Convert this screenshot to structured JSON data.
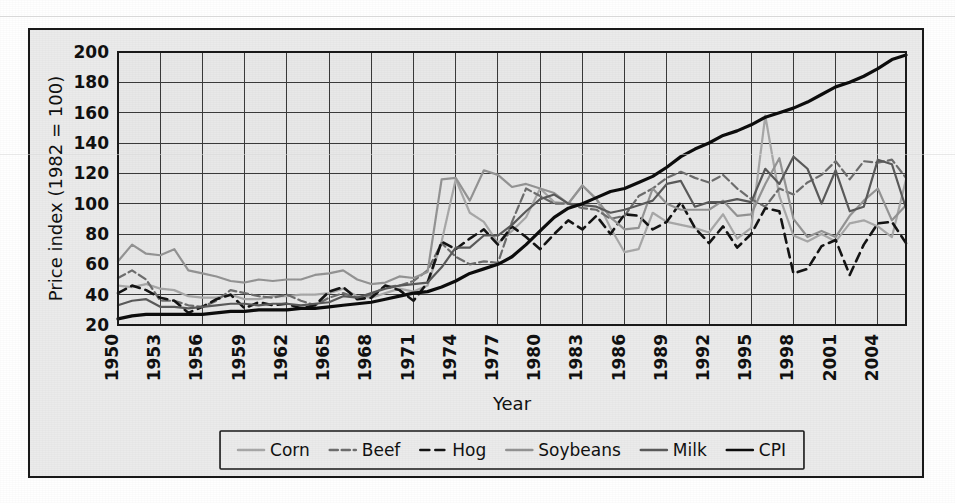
{
  "chart_data": {
    "type": "line",
    "title": "",
    "xlabel": "Year",
    "ylabel": "Price index (1982 = 100)",
    "xlim": [
      1950,
      2006
    ],
    "ylim": [
      20,
      200
    ],
    "ytick_step": 20,
    "xtick_step": 3,
    "grid": true,
    "legend_position": "bottom",
    "yticks": [
      20,
      40,
      60,
      80,
      100,
      120,
      140,
      160,
      180,
      200
    ],
    "xticks": [
      1950,
      1953,
      1956,
      1959,
      1962,
      1965,
      1968,
      1971,
      1974,
      1977,
      1980,
      1983,
      1986,
      1989,
      1992,
      1995,
      1998,
      2001,
      2004
    ],
    "x": [
      1950,
      1951,
      1952,
      1953,
      1954,
      1955,
      1956,
      1957,
      1958,
      1959,
      1960,
      1961,
      1962,
      1963,
      1964,
      1965,
      1966,
      1967,
      1968,
      1969,
      1970,
      1971,
      1972,
      1973,
      1974,
      1975,
      1976,
      1977,
      1978,
      1979,
      1980,
      1981,
      1982,
      1983,
      1984,
      1985,
      1986,
      1987,
      1988,
      1989,
      1990,
      1991,
      1992,
      1993,
      1994,
      1995,
      1996,
      1997,
      1998,
      1999,
      2000,
      2001,
      2002,
      2003,
      2004,
      2005,
      2006
    ],
    "series": [
      {
        "name": "Corn",
        "color": "#a8a8a8",
        "dash": "none",
        "width": 2.2,
        "values": [
          46,
          45,
          47,
          44,
          43,
          39,
          38,
          38,
          40,
          37,
          37,
          39,
          39,
          40,
          40,
          41,
          44,
          39,
          38,
          41,
          44,
          42,
          46,
          75,
          116,
          94,
          88,
          74,
          82,
          91,
          110,
          101,
          100,
          112,
          103,
          84,
          68,
          70,
          94,
          88,
          86,
          84,
          81,
          93,
          77,
          84,
          158,
          105,
          79,
          75,
          80,
          75,
          87,
          89,
          85,
          78,
          116
        ],
        "marker": "none"
      },
      {
        "name": "Beef",
        "color": "#6e6e6e",
        "dash": "8,4",
        "width": 2.2,
        "values": [
          51,
          56,
          50,
          36,
          36,
          33,
          32,
          36,
          43,
          41,
          39,
          38,
          40,
          36,
          33,
          38,
          41,
          38,
          40,
          45,
          46,
          49,
          56,
          74,
          65,
          60,
          62,
          61,
          88,
          110,
          105,
          100,
          100,
          97,
          96,
          90,
          92,
          105,
          110,
          117,
          121,
          117,
          114,
          119,
          110,
          103,
          98,
          110,
          106,
          114,
          119,
          128,
          116,
          128,
          127,
          129,
          117
        ],
        "marker": "none"
      },
      {
        "name": "Hog",
        "color": "#141414",
        "dash": "9,6",
        "width": 2.6,
        "values": [
          41,
          46,
          43,
          38,
          36,
          28,
          32,
          37,
          40,
          31,
          35,
          33,
          34,
          31,
          33,
          42,
          45,
          37,
          38,
          46,
          43,
          36,
          48,
          75,
          70,
          77,
          83,
          73,
          85,
          78,
          70,
          80,
          89,
          83,
          92,
          80,
          93,
          92,
          83,
          88,
          101,
          84,
          74,
          85,
          71,
          80,
          97,
          95,
          54,
          57,
          72,
          76,
          53,
          73,
          87,
          88,
          74
        ],
        "marker": "none"
      },
      {
        "name": "Soybeans",
        "color": "#949494",
        "dash": "none",
        "width": 2.2,
        "values": [
          62,
          73,
          67,
          66,
          70,
          56,
          54,
          52,
          49,
          48,
          50,
          49,
          50,
          50,
          53,
          54,
          56,
          50,
          47,
          48,
          52,
          51,
          55,
          116,
          117,
          102,
          122,
          119,
          111,
          113,
          110,
          107,
          100,
          112,
          103,
          91,
          83,
          84,
          110,
          100,
          96,
          96,
          96,
          102,
          92,
          93,
          113,
          130,
          90,
          78,
          82,
          78,
          92,
          102,
          110,
          89,
          99
        ],
        "marker": "none"
      },
      {
        "name": "Milk",
        "color": "#5a5a5a",
        "dash": "none",
        "width": 2.2,
        "values": [
          33,
          36,
          37,
          32,
          32,
          31,
          32,
          33,
          34,
          34,
          33,
          34,
          34,
          33,
          34,
          35,
          39,
          38,
          41,
          44,
          46,
          47,
          48,
          58,
          71,
          71,
          79,
          79,
          86,
          95,
          103,
          106,
          100,
          99,
          98,
          94,
          96,
          99,
          102,
          113,
          115,
          98,
          101,
          101,
          103,
          101,
          123,
          113,
          131,
          123,
          100,
          122,
          95,
          98,
          129,
          126,
          97
        ],
        "marker": "none"
      },
      {
        "name": "CPI",
        "color": "#0d0d0d",
        "dash": "none",
        "width": 3.2,
        "values": [
          24,
          26,
          27,
          27,
          27,
          27,
          27,
          28,
          29,
          29,
          30,
          30,
          30,
          31,
          31,
          32,
          33,
          34,
          35,
          37,
          39,
          41,
          42,
          45,
          49,
          54,
          57,
          60,
          65,
          73,
          82,
          91,
          97,
          100,
          104,
          108,
          110,
          114,
          118,
          124,
          131,
          136,
          140,
          145,
          148,
          152,
          157,
          160,
          163,
          167,
          172,
          177,
          180,
          184,
          189,
          195,
          198
        ],
        "marker": "none"
      }
    ]
  },
  "legend": {
    "items": [
      {
        "label": "Corn",
        "color": "#a8a8a8",
        "dash": "none"
      },
      {
        "label": "Beef",
        "color": "#6e6e6e",
        "dash": "8,4"
      },
      {
        "label": "Hog",
        "color": "#141414",
        "dash": "9,6"
      },
      {
        "label": "Soybeans",
        "color": "#949494",
        "dash": "none"
      },
      {
        "label": "Milk",
        "color": "#5a5a5a",
        "dash": "none"
      },
      {
        "label": "CPI",
        "color": "#0d0d0d",
        "dash": "none"
      }
    ]
  },
  "colors": {
    "page_background": "#ffffff",
    "figure_background": "#ebebeb",
    "plot_background": "#e8e8e8",
    "frame_border": "#1a1a1a",
    "grid": "#3a3a3a",
    "text": "#111111"
  }
}
